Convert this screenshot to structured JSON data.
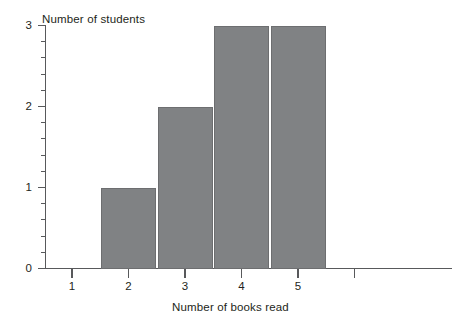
{
  "chart_data": {
    "type": "bar",
    "title": "",
    "xlabel": "Number of books read",
    "ylabel": "Number of students",
    "categories": [
      "1",
      "2",
      "3",
      "4",
      "5"
    ],
    "values": [
      0,
      1,
      2,
      3,
      3
    ],
    "xlim": [
      0.5,
      6.3
    ],
    "ylim": [
      0,
      3
    ],
    "yticks": [
      "0",
      "1",
      "2",
      "3"
    ],
    "y_minor_ticks_between": 4,
    "xticks": [
      "1",
      "2",
      "3",
      "4",
      "5"
    ],
    "grid": false,
    "legend": null,
    "bar_color": "#808284",
    "bar_border_color": "#6d6e70",
    "axis_color": "#58595b",
    "text_color": "#231f20"
  },
  "axes": {
    "y_title": "Number of students",
    "x_title": "Number of books read"
  }
}
